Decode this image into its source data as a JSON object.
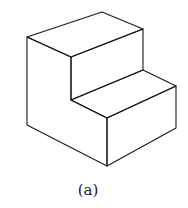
{
  "figure": {
    "caption": "(a)",
    "stroke_color": "#1a1a1a",
    "background": "#ffffff",
    "vertices": {
      "top_back_left": [
        27,
        37
      ],
      "top_back_right": [
        102,
        12
      ],
      "top_right": [
        143,
        29
      ],
      "top_front_inner": [
        71,
        57
      ],
      "inner_bottom": [
        71,
        100
      ],
      "step_back_right": [
        143,
        70
      ],
      "step_right": [
        176,
        86
      ],
      "front_corner_top": [
        107,
        118
      ],
      "front_bottom": [
        107,
        166
      ],
      "right_bottom": [
        176,
        128
      ],
      "left_bottom": [
        27,
        125
      ]
    }
  }
}
